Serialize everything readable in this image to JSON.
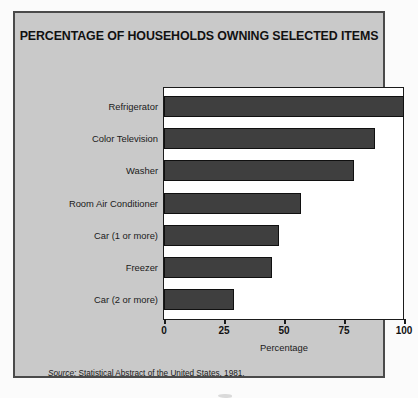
{
  "figure": {
    "source_note_lead": "Source:",
    "source_note_text": " Statistical Abstract of the United States, 1981."
  },
  "chart_data": {
    "type": "bar",
    "orientation": "horizontal",
    "title": "PERCENTAGE OF HOUSEHOLDS OWNING SELECTED ITEMS",
    "xlabel": "Percentage",
    "ylabel": "",
    "xlim": [
      0,
      100
    ],
    "xticks": [
      0,
      25,
      50,
      75,
      100
    ],
    "xticklabels": [
      "0",
      "25",
      "50",
      "75",
      "100"
    ],
    "grid": false,
    "legend": null,
    "categories": [
      "Refrigerator",
      "Color Television",
      "Washer",
      "Room Air Conditioner",
      "Car (1 or more)",
      "Freezer",
      "Car (2 or more)"
    ],
    "values": [
      100,
      88,
      79,
      57,
      48,
      45,
      29
    ],
    "bar_color": "#3f3f3f",
    "bar_edge_color": "#101010",
    "plot_background": "#ffffff",
    "panel_background": "#c9c9c9"
  }
}
